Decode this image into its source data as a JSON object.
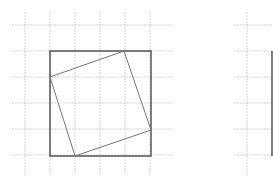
{
  "figure": {
    "colors": {
      "grid": "#c8c8c8",
      "outer_square": "#555555",
      "inner_square": "#777777",
      "background": "#ffffff"
    },
    "left_figure": {
      "grid_x": [
        25,
        50,
        75,
        100,
        125,
        150
      ],
      "grid_y": [
        25,
        51,
        77,
        103,
        129,
        155
      ],
      "grid_x_extent": [
        12,
        172
      ],
      "grid_y_extent": [
        12,
        175
      ],
      "outer_square": {
        "x1": 50,
        "y1": 51,
        "x2": 151,
        "y2": 156
      },
      "inner_square_points": "50,77 124,51 151,130 75,156"
    },
    "right_figure": {
      "grid_x": [
        247
      ],
      "grid_y": [
        25,
        51,
        77,
        103,
        129,
        155
      ],
      "grid_x_extent": [
        234,
        273
      ],
      "grid_y_extent": [
        12,
        175
      ],
      "outer_edge_x": 272
    }
  }
}
